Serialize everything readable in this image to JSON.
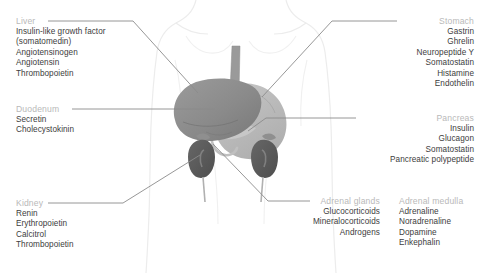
{
  "figure": {
    "background_color": "#ffffff",
    "header_color": "#b9b9b9",
    "text_color": "#3d3d3d",
    "leader_line_color": "#8b8b8b",
    "body_outline_color": "#ededed"
  },
  "groups": {
    "liver": {
      "header": "Liver",
      "align": "left",
      "items": [
        "Insulin-like growth factor",
        "(somatomedin)",
        "Angiotensinogen",
        "Angiotensin",
        "Thrombopoietin"
      ]
    },
    "duodenum": {
      "header": "Duodenum",
      "align": "left",
      "items": [
        "Secretin",
        "Cholecystokinin"
      ]
    },
    "kidney": {
      "header": "Kidney",
      "align": "left",
      "items": [
        "Renin",
        "Erythropoietin",
        "Calcitrol",
        "Thrombopoietin"
      ]
    },
    "stomach": {
      "header": "Stomach",
      "align": "right",
      "items": [
        "Gastrin",
        "Ghrelin",
        "Neuropeptide Y",
        "Somatostatin",
        "Histamine",
        "Endothelin"
      ]
    },
    "pancreas": {
      "header": "Pancreas",
      "align": "right",
      "items": [
        "Insulin",
        "Glucagon",
        "Somatostatin",
        "Pancreatic polypeptide"
      ]
    },
    "adrenal_glands": {
      "header": "Adrenal glands",
      "align": "right",
      "items": [
        "Glucocorticoids",
        "Mineralocorticoids",
        "Androgens"
      ]
    },
    "adrenal_medulla": {
      "header": "Adrenal medulla",
      "align": "left",
      "items": [
        "Adrenaline",
        "Noradrenaline",
        "Dopamine",
        "Enkephalin"
      ]
    }
  },
  "anatomy": {
    "organs": [
      {
        "name": "liver",
        "color": "#8c8c8c"
      },
      {
        "name": "stomach",
        "color": "#b4b4b4"
      },
      {
        "name": "esophagus",
        "color": "#9a9a9a"
      },
      {
        "name": "pancreas",
        "color": "#c9c9c9"
      },
      {
        "name": "duodenum",
        "color": "#c2c2c2"
      },
      {
        "name": "kidney-left",
        "color": "#5a5a5a"
      },
      {
        "name": "kidney-right",
        "color": "#5a5a5a"
      },
      {
        "name": "adrenal-gland-left",
        "color": "#8f8f8f"
      },
      {
        "name": "adrenal-gland-right",
        "color": "#8f8f8f"
      },
      {
        "name": "ureter-left",
        "color": "#b0b0b0"
      },
      {
        "name": "ureter-right",
        "color": "#b0b0b0"
      }
    ]
  }
}
